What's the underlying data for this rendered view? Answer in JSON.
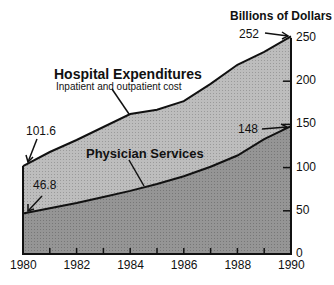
{
  "chart_data": {
    "type": "area",
    "title": "",
    "ylabel": "Billions of Dollars",
    "xlabel": "",
    "x": [
      1980,
      1981,
      1982,
      1983,
      1984,
      1985,
      1986,
      1987,
      1988,
      1989,
      1990
    ],
    "xticks": [
      "1980",
      "1982",
      "1984",
      "1986",
      "1988",
      "1990"
    ],
    "yticks": [
      "0",
      "50",
      "100",
      "150",
      "200",
      "250"
    ],
    "ylim": [
      0,
      250
    ],
    "grid": false,
    "series": [
      {
        "name": "Hospital Expenditures",
        "subtitle": "Inpatient and outpatient cost",
        "values": [
          101.6,
          118,
          132,
          147,
          162,
          167,
          177,
          197,
          219,
          234,
          252
        ],
        "color": "#b8b8b8"
      },
      {
        "name": "Physician Services",
        "values": [
          46.8,
          53,
          59,
          66,
          73,
          81,
          90,
          101,
          114,
          133,
          148
        ],
        "color": "#8e8e8e"
      }
    ],
    "annotations": [
      {
        "text": "101.6",
        "x": 1980,
        "series": "Hospital Expenditures"
      },
      {
        "text": "46.8",
        "x": 1980,
        "series": "Physician Services"
      },
      {
        "text": "252",
        "x": 1990,
        "series": "Hospital Expenditures"
      },
      {
        "text": "148",
        "x": 1990,
        "series": "Physician Services"
      }
    ]
  },
  "labels": {
    "ylabel": "Billions of Dollars",
    "hospital_title": "Hospital Expenditures",
    "hospital_sub": "Inpatient and outpatient cost",
    "physician_title": "Physician Services",
    "ann_101": "101.6",
    "ann_46": "46.8",
    "ann_252": "252",
    "ann_148": "148"
  },
  "yticks": [
    "0",
    "50",
    "100",
    "150",
    "200",
    "250"
  ],
  "xticks": [
    "1980",
    "1982",
    "1984",
    "1986",
    "1988",
    "1990"
  ]
}
